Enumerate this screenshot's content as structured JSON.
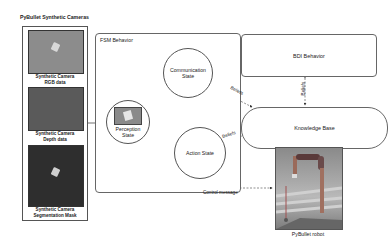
{
  "diagram": {
    "cameras_panel": {
      "title": "PyBullet Synthetic Cameras",
      "items": [
        {
          "caption_line1": "Synthetic Camera",
          "caption_line2": "RGB data",
          "color": "#8c8c8c"
        },
        {
          "caption_line1": "Synthetic Camera",
          "caption_line2": "Depth data",
          "color": "#5a5a5a"
        },
        {
          "caption_line1": "Synthetic Camera",
          "caption_line2": "Segmentation Mask",
          "color": "#2e2e2e"
        }
      ]
    },
    "fsm": {
      "title": "FSM Behavior",
      "states": {
        "perception": {
          "line1": "Perception",
          "line2": "State"
        },
        "communication": {
          "line1": "Communication",
          "line2": "State"
        },
        "action": {
          "line1": "Action State"
        }
      }
    },
    "bdi": {
      "label": "BDI Behavior"
    },
    "knowledge_base": {
      "label": "Knowledge Base"
    },
    "robot": {
      "caption": "PyBullet robot"
    },
    "edges": {
      "beliefs_comm_kb": "Beliefs",
      "beliefs_action_kb": "Beliefs",
      "beliefs_bdi_kb": "Beliefs",
      "control_message": "Control message"
    }
  }
}
